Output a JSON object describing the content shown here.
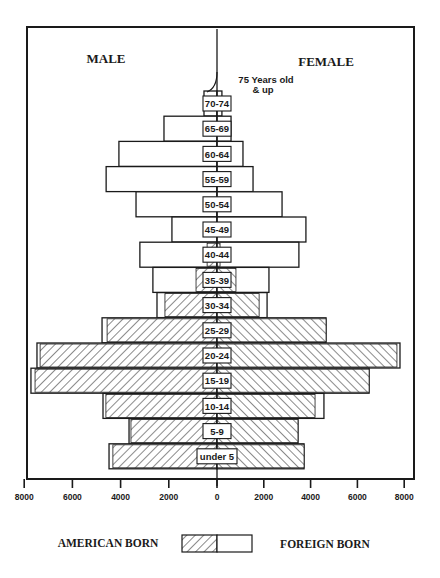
{
  "page_header": {
    "running_head": "",
    "page_number": ""
  },
  "chart_data": {
    "type": "bar",
    "subtype": "population-pyramid-stacked",
    "title": "",
    "left_label": "MALE",
    "right_label": "FEMALE",
    "annotation": "75 Years old & up",
    "annotation_lines": [
      "75 Years old",
      "& up"
    ],
    "categories": [
      "70-74",
      "65-69",
      "60-64",
      "55-59",
      "50-54",
      "45-49",
      "40-44",
      "35-39",
      "30-34",
      "25-29",
      "20-24",
      "15-19",
      "10-14",
      "5-9",
      "under 5"
    ],
    "series": [
      {
        "name": "MALE AMERICAN BORN",
        "side": "left",
        "pattern": "hatch",
        "values": [
          0,
          0,
          0,
          0,
          0,
          0,
          410,
          870,
          2160,
          4560,
          7340,
          7550,
          4610,
          3570,
          4320
        ]
      },
      {
        "name": "MALE FOREIGN BORN",
        "side": "left",
        "pattern": "blank",
        "values": [
          540,
          2200,
          4070,
          4600,
          3360,
          1870,
          2790,
          1790,
          330,
          210,
          130,
          170,
          120,
          80,
          160
        ]
      },
      {
        "name": "FEMALE AMERICAN BORN",
        "side": "right",
        "pattern": "hatch",
        "values": [
          0,
          0,
          0,
          0,
          0,
          0,
          130,
          810,
          1800,
          4660,
          7690,
          6500,
          4190,
          3460,
          3720
        ]
      },
      {
        "name": "FEMALE FOREIGN BORN",
        "side": "right",
        "pattern": "blank",
        "values": [
          210,
          600,
          1110,
          1540,
          2780,
          3800,
          3370,
          1410,
          340,
          0,
          130,
          0,
          380,
          0,
          0
        ]
      }
    ],
    "totals": {
      "male": [
        540,
        2200,
        4070,
        4600,
        3360,
        1870,
        3200,
        2660,
        2490,
        4770,
        7470,
        7720,
        4730,
        3650,
        4480
      ],
      "female": [
        210,
        600,
        1110,
        1540,
        2780,
        3800,
        3500,
        2220,
        2140,
        4660,
        7820,
        6500,
        4570,
        3460,
        3720
      ]
    },
    "x_ticks_left": [
      "8000",
      "6000",
      "4000",
      "2000"
    ],
    "x_tick_center": "0",
    "x_ticks_right": [
      "2000",
      "4000",
      "6000",
      "8000"
    ],
    "xlim": [
      -8000,
      8000
    ],
    "xlabel": "",
    "ylabel": "",
    "grid": false,
    "legend": {
      "position": "bottom",
      "entries": [
        {
          "label": "AMERICAN BORN",
          "pattern": "hatch"
        },
        {
          "label": "FOREIGN BORN",
          "pattern": "blank"
        }
      ]
    },
    "colors": {
      "ink": "#1a1a1a",
      "background": "#ffffff",
      "hatch": "#2a2a2a"
    }
  }
}
